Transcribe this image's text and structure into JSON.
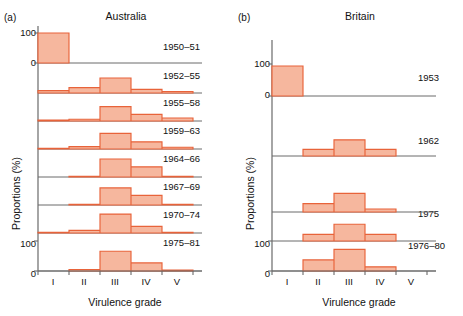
{
  "figure": {
    "caption_a": "(a)",
    "caption_b": "(b)",
    "ylabel": "Proportions (%)",
    "xlabel": "Virulence grade"
  },
  "panels": [
    {
      "letter": "(a)",
      "title": "Australia",
      "ylabel": "Proportions (%)",
      "xlabel": "Virulence grade",
      "ytick_top": "100",
      "ytick_bottom": "0",
      "ytick_lower_100": "100",
      "categories": [
        "I",
        "II",
        "III",
        "IV",
        "V"
      ],
      "rows": [
        {
          "label": "1950–51",
          "values": [
            100,
            0,
            0,
            0,
            0
          ]
        },
        {
          "label": "1952–55",
          "values": [
            8,
            18,
            50,
            12,
            5
          ]
        },
        {
          "label": "1955–58",
          "values": [
            3,
            6,
            48,
            22,
            10
          ]
        },
        {
          "label": "1959–63",
          "values": [
            2,
            8,
            52,
            24,
            6
          ]
        },
        {
          "label": "1964–66",
          "values": [
            0,
            2,
            60,
            34,
            2
          ]
        },
        {
          "label": "1967–69",
          "values": [
            0,
            2,
            57,
            32,
            2
          ]
        },
        {
          "label": "1970–74",
          "values": [
            2,
            9,
            63,
            22,
            2
          ]
        },
        {
          "label": "1975–81",
          "values": [
            1,
            5,
            66,
            27,
            3
          ]
        }
      ]
    },
    {
      "letter": "(b)",
      "title": "Britain",
      "ylabel": "Proportions (%)",
      "xlabel": "Virulence grade",
      "ytick_top": "100",
      "ytick_bottom": "0",
      "ytick_lower_100": "100",
      "categories": [
        "I",
        "II",
        "III",
        "IV",
        "V"
      ],
      "rows": [
        {
          "label": "1953",
          "values": [
            100,
            0,
            0,
            0,
            0
          ]
        },
        {
          "label": "1962",
          "values": [
            0,
            22,
            54,
            22,
            0
          ]
        },
        {
          "label": "1975",
          "values": [
            0,
            22,
            56,
            22,
            0
          ]
        },
        {
          "label": "1976–80",
          "values": [
            0,
            37,
            72,
            14,
            0
          ]
        },
        {
          "label": "",
          "values": [
            0,
            28,
            62,
            10,
            0
          ]
        }
      ]
    }
  ],
  "chart_data": {
    "type": "bar",
    "xlabel": "Virulence grade",
    "ylabel": "Proportions (%)",
    "ylim": [
      0,
      100
    ],
    "grid": false,
    "legend": "none",
    "categories": [
      "I",
      "II",
      "III",
      "IV",
      "V"
    ],
    "panels": [
      {
        "panel": "(a)",
        "title": "Australia",
        "series": [
          {
            "name": "1950–51",
            "values": [
              100,
              0,
              0,
              0,
              0
            ]
          },
          {
            "name": "1952–55",
            "values": [
              8,
              18,
              50,
              12,
              5
            ]
          },
          {
            "name": "1955–58",
            "values": [
              3,
              6,
              48,
              22,
              10
            ]
          },
          {
            "name": "1959–63",
            "values": [
              2,
              8,
              52,
              24,
              6
            ]
          },
          {
            "name": "1964–66",
            "values": [
              0,
              2,
              60,
              34,
              2
            ]
          },
          {
            "name": "1967–69",
            "values": [
              0,
              2,
              57,
              32,
              2
            ]
          },
          {
            "name": "1970–74",
            "values": [
              2,
              9,
              63,
              22,
              2
            ]
          },
          {
            "name": "1975–81",
            "values": [
              1,
              5,
              66,
              27,
              3
            ]
          }
        ]
      },
      {
        "panel": "(b)",
        "title": "Britain",
        "series": [
          {
            "name": "1953",
            "values": [
              100,
              0,
              0,
              0,
              0
            ]
          },
          {
            "name": "1962",
            "values": [
              0,
              22,
              54,
              22,
              0
            ]
          },
          {
            "name": "unlabelled",
            "values": [
              0,
              22,
              56,
              22,
              0
            ]
          },
          {
            "name": "1975",
            "values": [
              0,
              37,
              72,
              14,
              0
            ]
          },
          {
            "name": "1976–80",
            "values": [
              0,
              28,
              62,
              10,
              0
            ]
          }
        ]
      }
    ]
  }
}
